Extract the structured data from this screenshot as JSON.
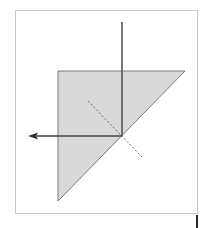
{
  "diagram": {
    "title": "",
    "elements": [
      {
        "name": "frame",
        "kind": "border"
      },
      {
        "name": "prism",
        "kind": "right-triangle",
        "fill": "#d9d9d9",
        "stroke": "#7a7a7a"
      },
      {
        "name": "incident-ray",
        "kind": "line",
        "direction": "down"
      },
      {
        "name": "reflected-ray",
        "kind": "arrow",
        "direction": "left"
      },
      {
        "name": "normal-line",
        "kind": "dashed-line"
      }
    ],
    "colors": {
      "prism_fill": "#d9d9d9",
      "prism_stroke": "#7a7a7a",
      "ray": "#444444",
      "frame": "#c8c8c8",
      "background": "#ffffff"
    }
  }
}
